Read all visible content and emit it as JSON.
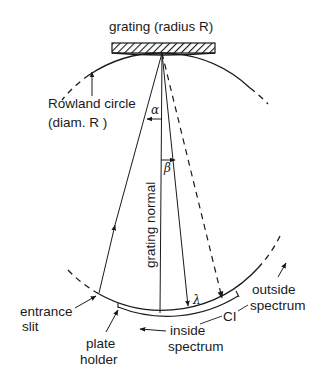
{
  "diagram": {
    "labels": {
      "grating": "grating (radius R)",
      "rowland_line1": "Rowland circle",
      "rowland_line2": "(diam. R )",
      "alpha": "α",
      "beta": "β",
      "normal": "grating normal",
      "lambda": "λ",
      "ci": "CI",
      "entrance_line1": "entrance",
      "entrance_line2": "slit",
      "plate_line1": "plate",
      "plate_line2": "holder",
      "inside_line1": "inside",
      "inside_line2": "spectrum",
      "outside_line1": "outside",
      "outside_line2": "spectrum"
    },
    "colors": {
      "ink": "#1a1a1a",
      "background": "#ffffff"
    }
  }
}
